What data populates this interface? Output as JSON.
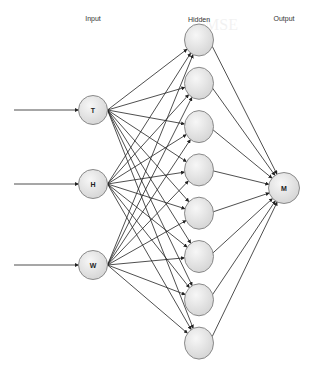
{
  "diagram": {
    "type": "neural-network",
    "layers": {
      "input": {
        "label": "Input",
        "nodes": [
          "T",
          "H",
          "W"
        ]
      },
      "hidden": {
        "label": "Hidden",
        "node_count": 8
      },
      "output": {
        "label": "Output",
        "nodes": [
          "M"
        ]
      }
    },
    "colors": {
      "node_fill_light": "#f4f4f4",
      "node_fill_dark": "#d6d6d6",
      "node_stroke": "#8a8a8a",
      "edge": "#222222"
    },
    "connections": "fully-connected input→hidden, hidden→output; external arrow into each input node"
  }
}
